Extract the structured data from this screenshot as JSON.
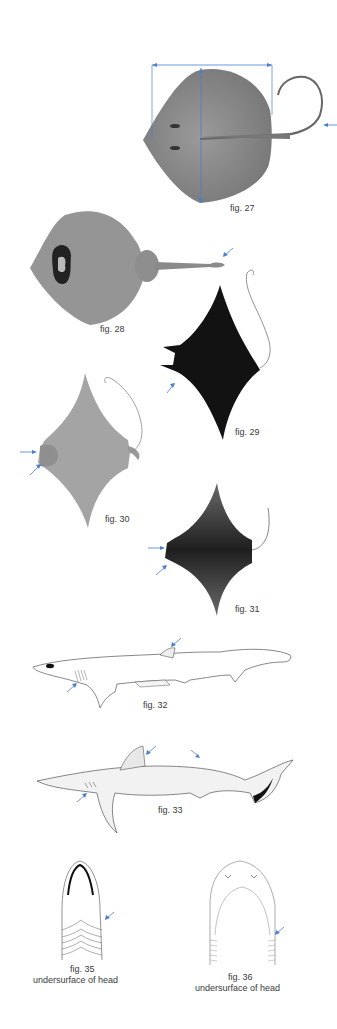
{
  "plate": {
    "accent_color": "#4a7fd0",
    "figures": [
      {
        "id": "fig27",
        "caption": "fig. 27",
        "subject": "stingray-dorsal-with-width-length-measure",
        "tone": "#8a8a8a"
      },
      {
        "id": "fig28",
        "caption": "fig. 28",
        "subject": "ray-dorsal-with-tail-fold",
        "tone": "#939393"
      },
      {
        "id": "fig29",
        "caption": "fig. 29",
        "subject": "manta-dorsal-dark",
        "tone": "#141414"
      },
      {
        "id": "fig30",
        "caption": "fig. 30",
        "subject": "devil-ray-ventral",
        "tone": "#a0a0a0"
      },
      {
        "id": "fig31",
        "caption": "fig. 31",
        "subject": "eagle-ray-dorsal",
        "tone": "#555555"
      },
      {
        "id": "fig32",
        "caption": "fig. 32",
        "subject": "shark-lateral-small-dorsal",
        "tone": "#ffffff"
      },
      {
        "id": "fig33",
        "caption": "fig. 33",
        "subject": "shark-lateral-dark-tail-tip",
        "tone": "#eeeeee"
      },
      {
        "id": "fig35",
        "caption": "fig. 35",
        "subcaption": "undersurface of head",
        "subject": "head-underside-long-gill-slits"
      },
      {
        "id": "fig36",
        "caption": "fig. 36",
        "subcaption": "undersurface of head",
        "subject": "head-underside-short-gill-slits"
      }
    ]
  }
}
